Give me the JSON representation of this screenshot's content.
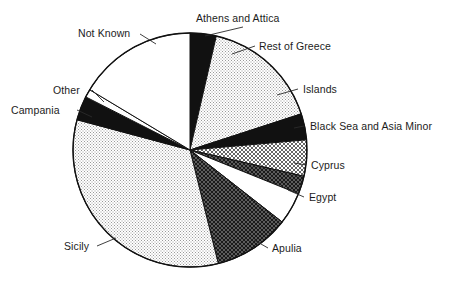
{
  "chart_data": {
    "type": "pie",
    "title": "",
    "subtitle": "",
    "xlabel": "",
    "ylabel": "",
    "legend_position": "none",
    "labels_position": "outside-callout",
    "grid": false,
    "units": "percent of total",
    "categories": [
      "Athens and Attica",
      "Rest of Greece",
      "Islands",
      "Black Sea and Asia Minor",
      "Cyprus",
      "Egypt",
      "Apulia",
      "Sicily",
      "Campania",
      "Other",
      "Not Known"
    ],
    "values": [
      3.6,
      16.4,
      3.6,
      5.0,
      2.5,
      4.4,
      10.6,
      33.1,
      3.3,
      1.1,
      16.4
    ],
    "angles_deg": [
      13,
      59,
      13,
      18,
      9,
      16,
      38,
      119,
      12,
      4,
      59
    ],
    "slices": [
      {
        "label": "Athens and Attica",
        "value": 3.6,
        "start_deg": 0,
        "end_deg": 13,
        "fill": "solid-black"
      },
      {
        "label": "Rest of Greece",
        "value": 16.4,
        "start_deg": 13,
        "end_deg": 72,
        "fill": "light-stipple"
      },
      {
        "label": "Islands",
        "value": 3.6,
        "start_deg": 72,
        "end_deg": 85,
        "fill": "solid-black"
      },
      {
        "label": "Black Sea and Asia Minor",
        "value": 5.0,
        "start_deg": 85,
        "end_deg": 103,
        "fill": "light-crosshatch"
      },
      {
        "label": "Cyprus",
        "value": 2.5,
        "start_deg": 103,
        "end_deg": 112,
        "fill": "dark-crosshatch"
      },
      {
        "label": "Egypt",
        "value": 4.4,
        "start_deg": 112,
        "end_deg": 128,
        "fill": "white"
      },
      {
        "label": "Apulia",
        "value": 10.6,
        "start_deg": 128,
        "end_deg": 166,
        "fill": "dark-crosshatch"
      },
      {
        "label": "Sicily",
        "value": 33.1,
        "start_deg": 166,
        "end_deg": 285,
        "fill": "light-stipple"
      },
      {
        "label": "Campania",
        "value": 3.3,
        "start_deg": 285,
        "end_deg": 297,
        "fill": "solid-black"
      },
      {
        "label": "Other",
        "value": 1.1,
        "start_deg": 297,
        "end_deg": 301,
        "fill": "white"
      },
      {
        "label": "Not Known",
        "value": 16.4,
        "start_deg": 301,
        "end_deg": 360,
        "fill": "white"
      }
    ]
  },
  "labels": {
    "athens_and_attica": "Athens and Attica",
    "rest_of_greece": "Rest of Greece",
    "islands": "Islands",
    "black_sea_and_asia_minor": "Black Sea and Asia Minor",
    "cyprus": "Cyprus",
    "egypt": "Egypt",
    "apulia": "Apulia",
    "sicily": "Sicily",
    "campania": "Campania",
    "other": "Other",
    "not_known": "Not Known"
  },
  "colors": {
    "outline": "#111111",
    "solid_black": "#111111",
    "white": "#ffffff",
    "background": "#ffffff",
    "text": "#1c1c1c"
  }
}
